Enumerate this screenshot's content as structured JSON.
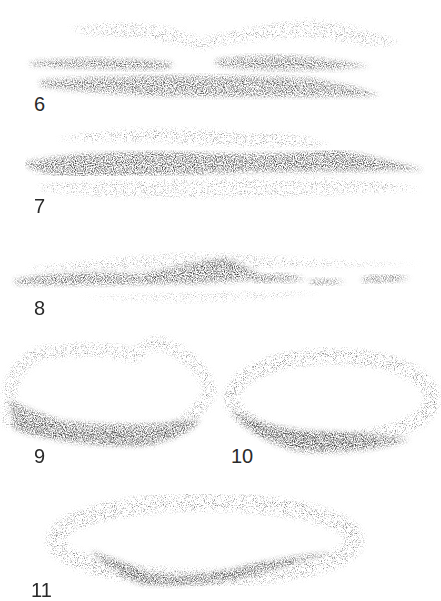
{
  "figures": [
    {
      "number": "6",
      "description": "Layered horizontal stratus cloud bands"
    },
    {
      "number": "7",
      "description": "Dense dark horizontal cloud band with light wisps above and below"
    },
    {
      "number": "8",
      "description": "Low dark cloud line with broken segments on the right"
    },
    {
      "number": "9",
      "description": "Curved cumulus form shaded along the lower edge"
    },
    {
      "number": "10",
      "description": "Oval ring-shaped cloud shaded heavily at the bottom"
    },
    {
      "number": "11",
      "description": "Wide lens-shaped cloud with dark curved base"
    }
  ],
  "colors": {
    "background": "#ffffff",
    "pencil_dark": "#3a3a3a",
    "pencil_light": "#9a9a9a",
    "label": "#2a2a2a"
  }
}
